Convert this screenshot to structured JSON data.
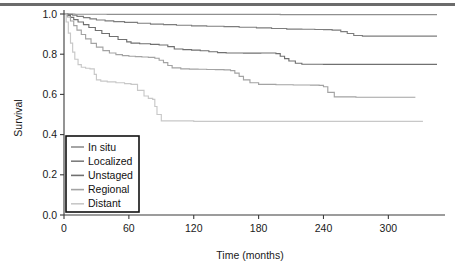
{
  "chart_data": {
    "type": "line",
    "title": "",
    "xlabel": "Time (months)",
    "ylabel": "Survival",
    "xlim": [
      0,
      345
    ],
    "ylim": [
      0,
      1.0
    ],
    "grid": false,
    "legend_position": "lower-left-inset",
    "xticks": [
      "0",
      "60",
      "120",
      "180",
      "240",
      "300"
    ],
    "xtick_values": [
      0,
      60,
      120,
      180,
      240,
      300
    ],
    "yticks": [
      "0.0",
      "0.2",
      "0.4",
      "0.6",
      "0.8",
      "1.0"
    ],
    "ytick_values": [
      0.0,
      0.2,
      0.4,
      0.6,
      0.8,
      1.0
    ],
    "curve_style": "kaplan-meier step",
    "series": [
      {
        "name": "In situ",
        "color": "#8f8f8f",
        "final_value": 1.0,
        "x": [
          0,
          6,
          10,
          20,
          40,
          80,
          140,
          200,
          260,
          320,
          345
        ],
        "y": [
          1.0,
          1.0,
          0.999,
          0.999,
          0.998,
          0.998,
          0.998,
          0.997,
          0.997,
          0.997,
          0.997
        ]
      },
      {
        "name": "Localized",
        "color": "#7d7d7d",
        "final_value": 0.89,
        "x": [
          0,
          4,
          8,
          12,
          18,
          24,
          30,
          38,
          46,
          56,
          68,
          80,
          92,
          104,
          118,
          132,
          148,
          162,
          178,
          192,
          206,
          220,
          232,
          240,
          248,
          256,
          262,
          268,
          276,
          300,
          345
        ],
        "y": [
          1.0,
          0.998,
          0.994,
          0.988,
          0.982,
          0.976,
          0.97,
          0.966,
          0.962,
          0.958,
          0.954,
          0.95,
          0.947,
          0.944,
          0.941,
          0.939,
          0.937,
          0.934,
          0.931,
          0.928,
          0.925,
          0.924,
          0.923,
          0.922,
          0.92,
          0.912,
          0.903,
          0.893,
          0.89,
          0.89,
          0.89
        ]
      },
      {
        "name": "Unstaged",
        "color": "#707070",
        "final_value": 0.75,
        "x": [
          0,
          3,
          6,
          9,
          13,
          18,
          23,
          29,
          35,
          42,
          50,
          58,
          62,
          70,
          80,
          88,
          96,
          102,
          110,
          118,
          126,
          134,
          142,
          150,
          158,
          166,
          174,
          182,
          190,
          196,
          200,
          204,
          208,
          214,
          220,
          240,
          280,
          345
        ],
        "y": [
          1.0,
          0.993,
          0.983,
          0.972,
          0.96,
          0.947,
          0.933,
          0.918,
          0.903,
          0.888,
          0.873,
          0.861,
          0.855,
          0.852,
          0.849,
          0.846,
          0.838,
          0.826,
          0.823,
          0.82,
          0.817,
          0.812,
          0.808,
          0.806,
          0.806,
          0.805,
          0.805,
          0.806,
          0.806,
          0.803,
          0.79,
          0.778,
          0.766,
          0.755,
          0.75,
          0.749,
          0.749,
          0.749
        ]
      },
      {
        "name": "Regional",
        "color": "#a3a3a3",
        "final_value": 0.585,
        "x": [
          0,
          3,
          6,
          9,
          12,
          16,
          20,
          25,
          30,
          36,
          42,
          48,
          54,
          60,
          66,
          72,
          78,
          84,
          88,
          92,
          96,
          100,
          108,
          116,
          124,
          132,
          140,
          148,
          154,
          158,
          162,
          166,
          172,
          180,
          196,
          212,
          228,
          236,
          240,
          244,
          250,
          270,
          310,
          325
        ],
        "y": [
          1.0,
          0.985,
          0.965,
          0.942,
          0.92,
          0.898,
          0.876,
          0.854,
          0.835,
          0.818,
          0.806,
          0.798,
          0.793,
          0.79,
          0.788,
          0.786,
          0.784,
          0.78,
          0.77,
          0.758,
          0.744,
          0.732,
          0.727,
          0.726,
          0.725,
          0.724,
          0.723,
          0.722,
          0.718,
          0.706,
          0.69,
          0.672,
          0.658,
          0.65,
          0.648,
          0.647,
          0.646,
          0.645,
          0.638,
          0.61,
          0.588,
          0.586,
          0.586,
          0.586
        ]
      },
      {
        "name": "Distant",
        "color": "#c8c8c8",
        "final_value": 0.465,
        "x": [
          0,
          2,
          4,
          6,
          8,
          10,
          13,
          16,
          20,
          24,
          28,
          30,
          34,
          40,
          48,
          56,
          62,
          68,
          74,
          78,
          82,
          84,
          86,
          90,
          120,
          180,
          240,
          300,
          332
        ],
        "y": [
          1.0,
          0.96,
          0.905,
          0.855,
          0.81,
          0.775,
          0.748,
          0.735,
          0.73,
          0.727,
          0.7,
          0.672,
          0.666,
          0.662,
          0.658,
          0.654,
          0.65,
          0.62,
          0.592,
          0.58,
          0.575,
          0.54,
          0.5,
          0.468,
          0.466,
          0.466,
          0.466,
          0.466,
          0.466
        ]
      }
    ]
  },
  "legend": {
    "entries": [
      {
        "label": "In situ"
      },
      {
        "label": "Localized"
      },
      {
        "label": "Unstaged"
      },
      {
        "label": "Regional"
      },
      {
        "label": "Distant"
      }
    ]
  }
}
